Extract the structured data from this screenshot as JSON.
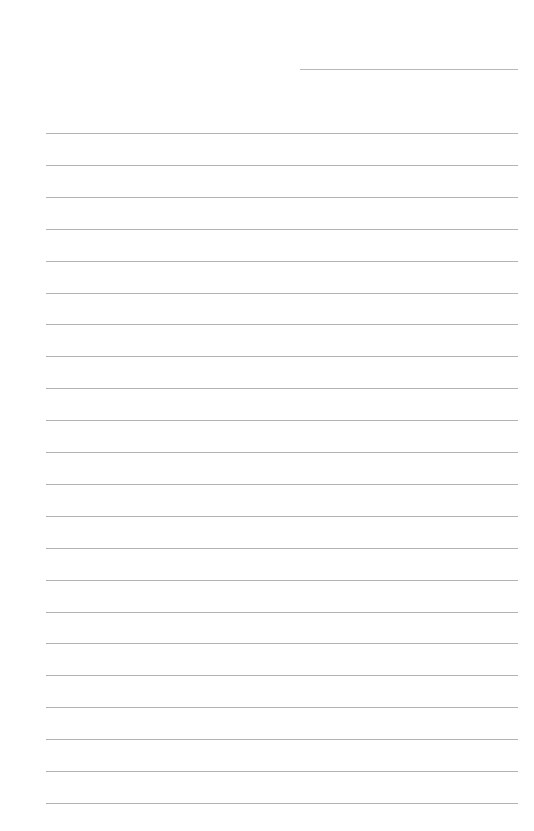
{
  "page": {
    "type": "lined-paper",
    "background": "#ffffff",
    "line_color": "#b4b4b4",
    "date_line": {
      "x": 300,
      "y": 69,
      "width": 218
    },
    "rules": {
      "count": 22,
      "x": 46,
      "width": 472,
      "first_y": 133,
      "spacing": 31.9
    }
  }
}
